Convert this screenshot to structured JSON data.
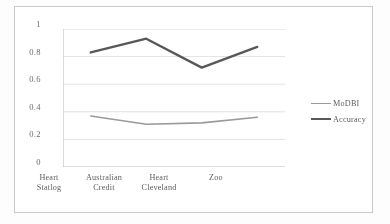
{
  "chart_data": {
    "type": "line",
    "title": "",
    "xlabel": "",
    "ylabel": "",
    "categories": [
      "Heart Statlog",
      "Australian Credit",
      "Heart Cleveland",
      "Zoo"
    ],
    "categories_lines": [
      [
        "Heart",
        "Statlog"
      ],
      [
        "Australian",
        "Credit"
      ],
      [
        "Heart",
        "Cleveland"
      ],
      [
        "Zoo",
        ""
      ]
    ],
    "series": [
      {
        "name": "MoDBI",
        "values": [
          0.37,
          0.31,
          0.32,
          0.36
        ],
        "color": "#9a9a9a",
        "width": 1.6
      },
      {
        "name": "Accuracy",
        "values": [
          0.83,
          0.93,
          0.72,
          0.87
        ],
        "color": "#585858",
        "width": 2.3
      }
    ],
    "ylim": [
      0,
      1
    ],
    "yticks": [
      0,
      0.2,
      0.4,
      0.6,
      0.8,
      1
    ],
    "ytick_labels": [
      "0",
      "0.2",
      "0.4",
      "0.6",
      "0.8",
      "1"
    ],
    "grid": true,
    "grid_axis": "y",
    "grid_color": "#dcdcdc",
    "legend_position": "right",
    "markers": false
  },
  "legend": {
    "entries": [
      {
        "label": "MoDBI",
        "color": "#9a9a9a",
        "width": 1.6
      },
      {
        "label": "Accuracy",
        "color": "#585858",
        "width": 2.3
      }
    ]
  },
  "axes": {
    "y_tick_labels": [
      "1",
      "0.8",
      "0.6",
      "0.4",
      "0.2",
      "0"
    ],
    "x_tick_labels": [
      "Heart Statlog",
      "Australian Credit",
      "Heart Cleveland",
      "Zoo"
    ]
  },
  "style": {
    "frame_color": "#c9c9c9",
    "axis_color": "#c0c0c0",
    "text_color": "#5e5e5e",
    "background": "#ffffff"
  }
}
